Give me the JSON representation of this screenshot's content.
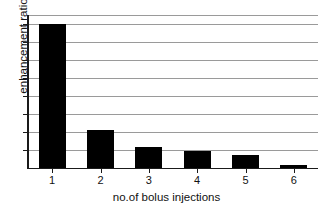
{
  "chart_data": {
    "type": "bar",
    "title": "",
    "xlabel": "no.of bolus injections",
    "ylabel": "enhancement ratio",
    "categories": [
      "1",
      "2",
      "3",
      "4",
      "5",
      "6"
    ],
    "values": [
      8.0,
      2.1,
      1.15,
      0.95,
      0.75,
      0.18
    ],
    "ylim": [
      0,
      8.5
    ],
    "xlim": [
      0.5,
      6.5
    ],
    "grid": true,
    "gridlines": [
      1,
      2,
      3,
      4,
      5,
      6,
      7,
      8
    ],
    "legend": "none",
    "series": [
      {
        "name": "enhancement ratio",
        "values": [
          8.0,
          2.1,
          1.15,
          0.95,
          0.75,
          0.18
        ]
      }
    ],
    "bar_color": "#000000",
    "grid_color": "#9a9a9a",
    "axis_color": "#1a1a1a",
    "background": "#ffffff",
    "y_tick_labels": [],
    "annotations": []
  },
  "axes": {
    "y_title": "enhancement ratio",
    "x_title": "no.of bolus injections",
    "x_tick_labels": [
      "1",
      "2",
      "3",
      "4",
      "5",
      "6"
    ]
  }
}
